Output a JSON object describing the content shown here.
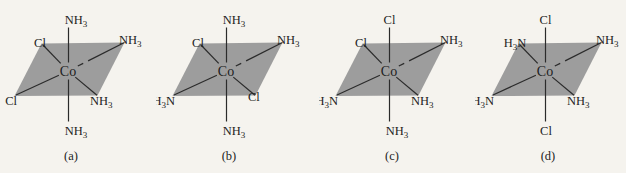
{
  "figure": {
    "central_atom": "Co",
    "structures": [
      {
        "caption": "(a)",
        "ligands": {
          "top": "NH3",
          "bottom": "NH3",
          "top_left": "Cl",
          "top_right": "NH3",
          "bottom_left": "Cl",
          "bottom_right": "NH3"
        }
      },
      {
        "caption": "(b)",
        "ligands": {
          "top": "NH3",
          "bottom": "NH3",
          "top_left": "Cl",
          "top_right": "NH3",
          "bottom_left": "H3N",
          "bottom_right": "Cl"
        }
      },
      {
        "caption": "(c)",
        "ligands": {
          "top": "Cl",
          "bottom": "NH3",
          "top_left": "Cl",
          "top_right": "NH3",
          "bottom_left": "H3N",
          "bottom_right": "NH3"
        }
      },
      {
        "caption": "(d)",
        "ligands": {
          "top": "Cl",
          "bottom": "Cl",
          "top_left": "H3N",
          "top_right": "NH3",
          "bottom_left": "H3N",
          "bottom_right": "NH3"
        }
      }
    ],
    "colors": {
      "background": "#f5f3ee",
      "plane_fill": "#9d9d9d",
      "bond": "#2b2b2b",
      "text": "#1d1d1d"
    }
  }
}
